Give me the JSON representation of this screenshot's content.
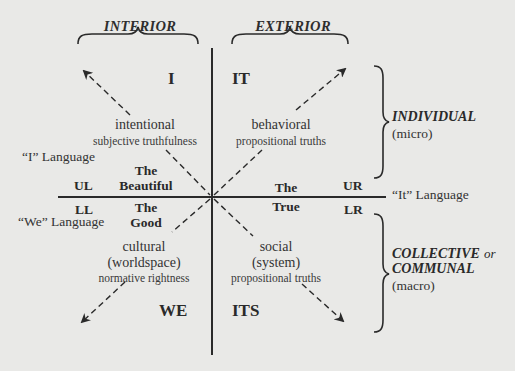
{
  "diagram": {
    "column_headers": {
      "interior": "INTERIOR",
      "exterior": "EXTERIOR"
    },
    "row_headers": {
      "individual": {
        "label": "INDIVIDUAL",
        "sub": "(micro)"
      },
      "collective": {
        "label_line1": "COLLECTIVE",
        "label_or": "or",
        "label_line2": "COMMUNAL",
        "sub": "(macro)"
      }
    },
    "quadrants": {
      "upper_left": {
        "pronoun": "I",
        "code": "UL",
        "title": "intentional",
        "subtitle": "subjective truthfulness",
        "value_line1": "The",
        "value_line2": "Beautiful"
      },
      "upper_right": {
        "pronoun": "IT",
        "code": "UR",
        "title": "behavioral",
        "subtitle": "propositional truths",
        "value_line1": "The",
        "value_line2": "True"
      },
      "lower_left": {
        "pronoun": "WE",
        "code": "LL",
        "title": "cultural",
        "title2": "(worldspace)",
        "subtitle": "normative rightness",
        "value_line1": "The",
        "value_line2": "Good"
      },
      "lower_right": {
        "pronoun": "ITS",
        "code": "LR",
        "title": "social",
        "title2": "(system)",
        "subtitle": "propositional truths"
      }
    },
    "languages": {
      "i": "“I” Language",
      "we": "“We” Language",
      "it": "“It” Language"
    },
    "colors": {
      "background": "#e9e9e7",
      "ink": "#2a2a2a"
    }
  }
}
